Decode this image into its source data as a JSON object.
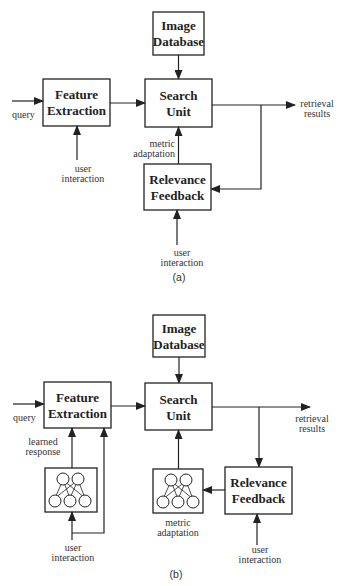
{
  "figure_a": {
    "caption": "(a)",
    "blocks": {
      "image_database": [
        "Image",
        "Database"
      ],
      "feature_extraction": [
        "Feature",
        "Extraction"
      ],
      "search_unit": [
        "Search",
        "Unit"
      ],
      "relevance_feedback": [
        "Relevance",
        "Feedback"
      ]
    },
    "labels": {
      "query": "query",
      "retrieval_results": [
        "retrieval",
        "results"
      ],
      "metric_adaptation": [
        "metric",
        "adaptation"
      ],
      "user_interaction_fe": [
        "user",
        "interaction"
      ],
      "user_interaction_rf": [
        "user",
        "interaction"
      ]
    }
  },
  "figure_b": {
    "caption": "(b)",
    "blocks": {
      "image_database": [
        "Image",
        "Database"
      ],
      "feature_extraction": [
        "Feature",
        "Extraction"
      ],
      "search_unit": [
        "Search",
        "Unit"
      ],
      "relevance_feedback": [
        "Relevance",
        "Feedback"
      ],
      "neural_net_left": "neural-network-icon",
      "neural_net_metric": "neural-network-icon"
    },
    "labels": {
      "query": "query",
      "retrieval_results": [
        "retrieval",
        "results"
      ],
      "learned_response": [
        "learned",
        "response"
      ],
      "metric_adaptation": [
        "metric",
        "adaptation"
      ],
      "user_interaction_fe": [
        "user",
        "interaction"
      ],
      "user_interaction_rf": [
        "user",
        "interaction"
      ]
    }
  }
}
